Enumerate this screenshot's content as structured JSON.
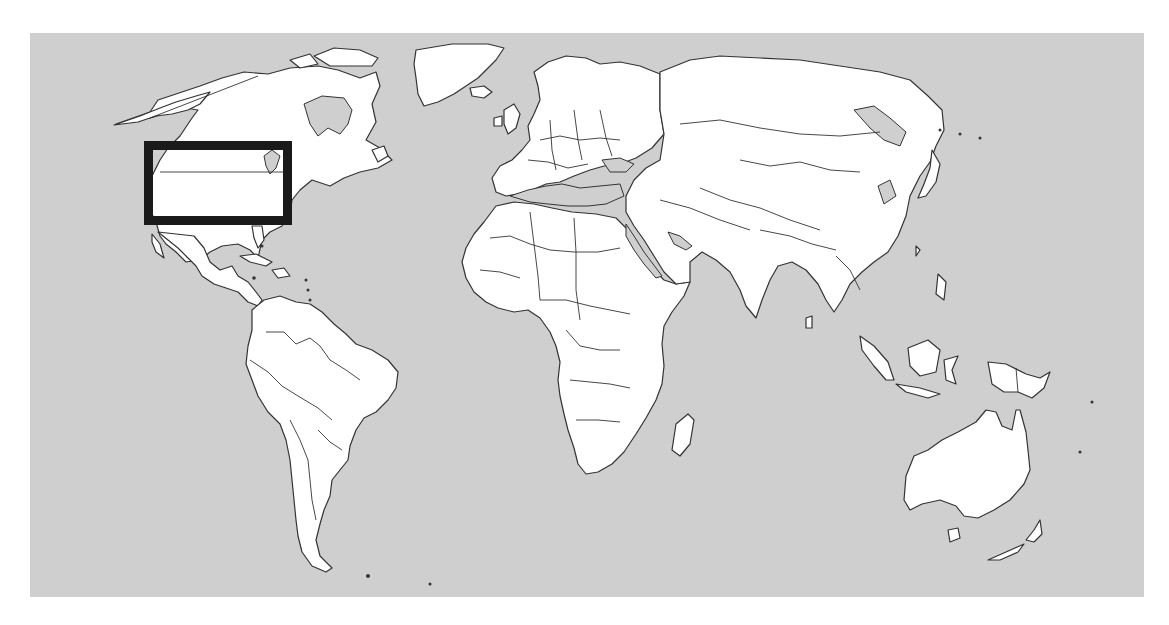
{
  "map": {
    "type": "world-political-outline",
    "projection": "equirectangular-like",
    "colors": {
      "ocean": "#cfcfcf",
      "land": "#ffffff",
      "outline": "#333333",
      "highlight_box": "#1a1a1a",
      "page_background": "#ffffff"
    },
    "extent_px": {
      "left": 30,
      "top": 33,
      "right": 1144,
      "bottom": 597
    },
    "highlight": {
      "label": "",
      "region": "Northeastern United States / Great Lakes",
      "box_px": {
        "x": 148,
        "y": 145,
        "width": 140,
        "height": 76
      },
      "stroke_width": 9
    },
    "visible_regions": [
      "North America",
      "Greenland",
      "Central America",
      "Caribbean",
      "South America",
      "Europe",
      "Africa",
      "Middle East",
      "Asia",
      "Indonesia",
      "Australia",
      "New Zealand",
      "Madagascar"
    ],
    "text_labels": []
  }
}
